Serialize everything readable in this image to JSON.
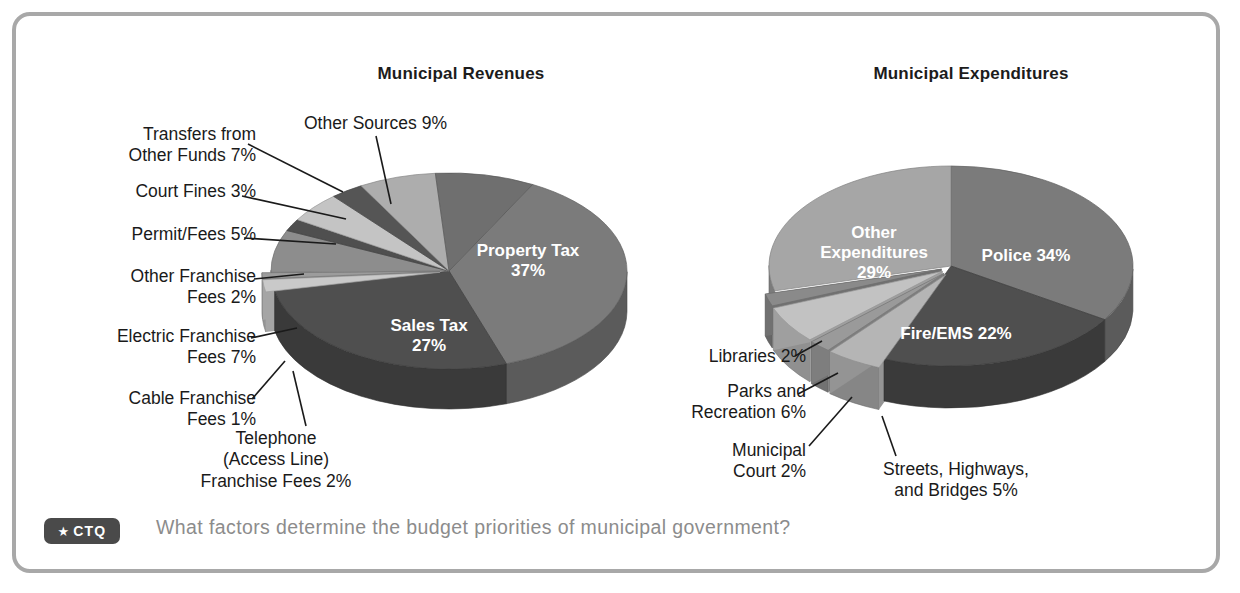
{
  "frame": {
    "border_color": "#a8a8a8"
  },
  "charts": {
    "revenues": {
      "title": "Municipal Revenues"
    },
    "expenditures": {
      "title": "Municipal Expenditures"
    }
  },
  "footer": {
    "badge_star": "★",
    "badge_label": "CTQ",
    "question": "What factors determine the budget priorities of municipal government?",
    "badge_bg": "#4a4a4a",
    "question_color": "#8c8c8c"
  },
  "revenue_labels": {
    "transfers": "Transfers from\nOther Funds 7%",
    "court_fines": "Court Fines 3%",
    "permit_fees": "Permit/Fees 5%",
    "other_franchise": "Other Franchise\nFees 2%",
    "electric_franchise": "Electric Franchise\nFees 7%",
    "cable_franchise": "Cable Franchise\nFees 1%",
    "telephone": "Telephone\n(Access Line)\nFranchise Fees 2%",
    "other_sources": "Other Sources 9%",
    "property_tax_l1": "Property Tax",
    "property_tax_l2": "37%",
    "sales_tax_l1": "Sales Tax",
    "sales_tax_l2": "27%"
  },
  "expenditure_labels": {
    "libraries": "Libraries 2%",
    "parks": "Parks and\nRecreation 6%",
    "municipal_court": "Municipal\nCourt 2%",
    "streets": "Streets, Highways,\nand Bridges 5%",
    "other_exp_l1": "Other",
    "other_exp_l2": "Expenditures",
    "other_exp_l3": "29%",
    "police": "Police 34%",
    "fire_ems": "Fire/EMS 22%"
  },
  "chart_data": [
    {
      "type": "pie",
      "title": "Municipal Revenues",
      "unit": "percent",
      "three_d": true,
      "categories": [
        "Property Tax",
        "Sales Tax",
        "Telephone (Access Line) Franchise Fees",
        "Cable Franchise Fees",
        "Electric Franchise Fees",
        "Other Franchise Fees",
        "Permit/Fees",
        "Court Fines",
        "Transfers from Other Funds",
        "Other Sources"
      ],
      "values": [
        37,
        27,
        2,
        1,
        7,
        2,
        5,
        3,
        7,
        9
      ],
      "labels": [
        "Property Tax 37%",
        "Sales Tax 27%",
        "Telephone (Access Line) Franchise Fees 2%",
        "Cable Franchise Fees 1%",
        "Electric Franchise Fees 7%",
        "Other Franchise Fees 2%",
        "Permit/Fees 5%",
        "Court Fines 3%",
        "Transfers from Other Funds 7%",
        "Other Sources 9%"
      ],
      "colors": [
        "#7b7b7b",
        "#4f4f4f",
        "#c9c9c9",
        "#a0a0a0",
        "#8d8d8d",
        "#5a5a5a",
        "#bdbdbd",
        "#545454",
        "#a9a9a9",
        "#6f6f6f"
      ],
      "legend": "none",
      "grid": false
    },
    {
      "type": "pie",
      "title": "Municipal Expenditures",
      "unit": "percent",
      "three_d": true,
      "categories": [
        "Police",
        "Fire/EMS",
        "Streets, Highways, and Bridges",
        "Municipal Court",
        "Parks and Recreation",
        "Libraries",
        "Other Expenditures"
      ],
      "values": [
        34,
        22,
        5,
        2,
        6,
        2,
        29
      ],
      "labels": [
        "Police 34%",
        "Fire/EMS 22%",
        "Streets, Highways, and Bridges 5%",
        "Municipal Court 2%",
        "Parks and Recreation 6%",
        "Libraries 2%",
        "Other Expenditures 29%"
      ],
      "colors": [
        "#7b7b7b",
        "#4f4f4f",
        "#b5b5b5",
        "#9a9a9a",
        "#c4c4c4",
        "#8a8a8a",
        "#a6a6a6"
      ],
      "legend": "none",
      "grid": false
    }
  ]
}
